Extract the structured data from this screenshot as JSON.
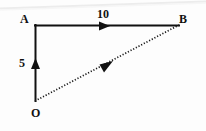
{
  "figure": {
    "background_color": "#fdfdfd",
    "stroke_color": "#111111",
    "artifact_color": "#ededed",
    "vertices": [
      {
        "name": "A",
        "label": "A",
        "x": 35,
        "y": 25
      },
      {
        "name": "B",
        "label": "B",
        "x": 178,
        "y": 25
      },
      {
        "name": "O",
        "label": "O",
        "x": 35,
        "y": 101
      }
    ],
    "edges": [
      {
        "name": "edge-AB",
        "from": "A",
        "to": "B",
        "style": "solid",
        "arrow": "midpoint",
        "arrow_direction": "right",
        "measure_label": "10"
      },
      {
        "name": "edge-OA",
        "from": "O",
        "to": "A",
        "style": "solid",
        "arrow": "midpoint",
        "arrow_direction": "up",
        "measure_label": "5"
      },
      {
        "name": "edge-OB",
        "from": "O",
        "to": "B",
        "style": "dotted",
        "arrow": "midpoint",
        "arrow_direction": "up-right",
        "measure_label": ""
      }
    ],
    "labels": {
      "vertex_a": "A",
      "vertex_b": "B",
      "vertex_o": "O",
      "measure_horizontal": "10",
      "measure_vertical": "5"
    }
  }
}
